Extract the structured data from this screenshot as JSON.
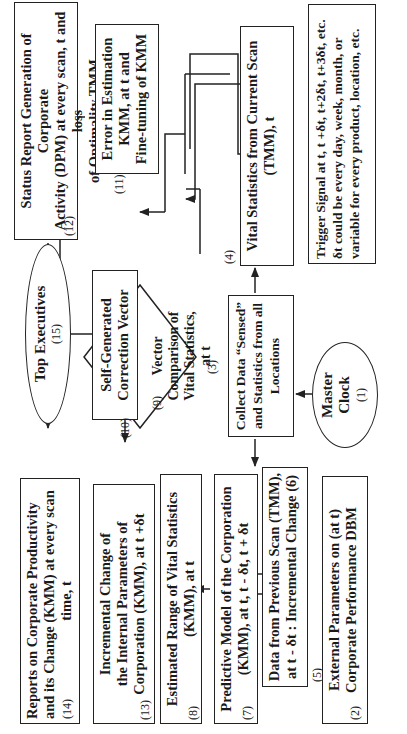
{
  "diagram": {
    "orientation": "rotated -90 degrees (text reads bottom-to-top)",
    "nodes": [
      {
        "id": 1,
        "label": "Master Clock",
        "number": "(1)",
        "shape": "ellipse"
      },
      {
        "id": 2,
        "label": "External Parameters on (at t) Corporate Performance DBM",
        "number": "(2)",
        "shape": "box"
      },
      {
        "id": 3,
        "label": "Collect Data “Sensed” and Statistics from all Locations",
        "number": "(3)",
        "shape": "box"
      },
      {
        "id": 4,
        "label": "Vital Statistics from Current Scan (TMM), t",
        "number": "(4)",
        "shape": "box"
      },
      {
        "id": 5,
        "label": "Data from Previous Scan (TMM), at t - δt : Incremental Change (6)",
        "number": "(5)",
        "shape": "box"
      },
      {
        "id": 7,
        "label": "Predictive Model of the Corporation (KMM), at t, t - δt, t + δt",
        "number": "(7)",
        "shape": "box"
      },
      {
        "id": 8,
        "label": "Estimated Range of Vital Statistics (KMM), at t",
        "number": "(8)",
        "shape": "box"
      },
      {
        "id": 9,
        "label": "Vector Comparison of Vital Statistics, at t",
        "number": "(9)",
        "shape": "diamond"
      },
      {
        "id": 10,
        "label": "Self-Generated Correction Vector",
        "number": "(10)",
        "shape": "box"
      },
      {
        "id": 11,
        "label": "Error in Estimation KMM, at t and Fine-tuning of KMM",
        "number": "(11)",
        "shape": "box"
      },
      {
        "id": 12,
        "label": "Status Report Generation of Corporate Activity (DPM) at every scan, t and loss of Optimality TMM",
        "number": "(12)",
        "shape": "box"
      },
      {
        "id": 13,
        "label": "Incremental Change of the Internal Parameters of Corporation (KMM), at t +δt",
        "number": "(13)",
        "shape": "box"
      },
      {
        "id": 14,
        "label": "Reports on Corporate Productivity and its Change (KMM) at every scan time, t",
        "number": "(14)",
        "shape": "box"
      },
      {
        "id": 15,
        "label": "Top Executives",
        "number": "(15)",
        "shape": "ellipse"
      }
    ],
    "note": {
      "line1": "Trigger Signal at t, t +δt, t+2δt, t+3δt, etc.",
      "line2": "δt could be every day, week, month, or",
      "line3": "variable for every product, location, etc."
    },
    "text": {
      "n1a": "Master",
      "n1b": "Clock",
      "n1n": "(1)",
      "n2a": "External Parameters on (at t)",
      "n2b": "Corporate Performance DBM",
      "n2n": "(2)",
      "n3a": "Collect Data “Sensed”",
      "n3b": "and Statistics from all",
      "n3c": "Locations",
      "n3n": "(3)",
      "n4a": "Vital Statistics from Current Scan",
      "n4b": "(TMM), t",
      "n4n": "(4)",
      "n5a": "Data from Previous Scan (TMM),",
      "n5b": "at t - δt : Incremental Change (6)",
      "n5n": "(5)",
      "n7a": "Predictive Model of the Corporation",
      "n7b": "(KMM), at t, t - δt, t + δt",
      "n7n": "(7)",
      "n8a": "Estimated Range of Vital Statistics",
      "n8b": "(KMM), at t",
      "n8n": "(8)",
      "n9a": "Vector",
      "n9b": "Comparison of",
      "n9c": "Vital Statistics,",
      "n9d": "at t",
      "n9n": "(9)",
      "n10a": "Self-Generated",
      "n10b": "Correction Vector",
      "n10n": "(10)",
      "n11a": "Error in Estimation",
      "n11b": "KMM, at t and",
      "n11c": "Fine-tuning of KMM",
      "n11n": "(11)",
      "n12a": "Status Report Generation of Corporate",
      "n12b": "Activity (DPM) at every scan, t and loss",
      "n12c": "of Optimality TMM",
      "n12n": "(12)",
      "n13a": "Incremental Change of",
      "n13b": "the Internal Parameters of",
      "n13c": "Corporation (KMM), at t +δt",
      "n13n": "(13)",
      "n14a": "Reports on Corporate Productivity",
      "n14b": "and its Change (KMM) at every scan",
      "n14c": "time, t",
      "n14n": "(14)",
      "n15a": "Top Executives",
      "n15n": "(15)"
    },
    "edges": [
      [
        "1",
        "3"
      ],
      [
        "3",
        "4"
      ],
      [
        "3",
        "5"
      ],
      [
        "2",
        "5"
      ],
      [
        "5",
        "7"
      ],
      [
        "5",
        "7b"
      ],
      [
        "7",
        "8"
      ],
      [
        "8",
        "9"
      ],
      [
        "4",
        "9"
      ],
      [
        "9",
        "10"
      ],
      [
        "10",
        "13"
      ],
      [
        "10",
        "11"
      ],
      [
        "11",
        "12"
      ],
      [
        "12",
        "15"
      ],
      [
        "15",
        "14"
      ]
    ]
  }
}
